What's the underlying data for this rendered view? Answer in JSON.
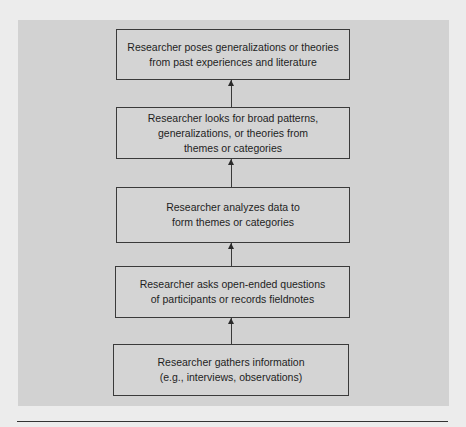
{
  "diagram": {
    "type": "flowchart",
    "direction": "bottom-to-top",
    "steps": [
      {
        "label": "Researcher poses generalizations or theories\nfrom past experiences and literature"
      },
      {
        "label": "Researcher looks for broad patterns,\ngeneralizations, or theories from\nthemes or categories"
      },
      {
        "label": "Researcher analyzes data to\nform themes or categories"
      },
      {
        "label": "Researcher asks open-ended questions\nof participants or records fieldnotes"
      },
      {
        "label": "Researcher gathers information\n(e.g., interviews, observations)"
      }
    ],
    "colors": {
      "panel": "#d2d2d2",
      "page": "#ececec",
      "border": "#3a3a3a"
    }
  }
}
